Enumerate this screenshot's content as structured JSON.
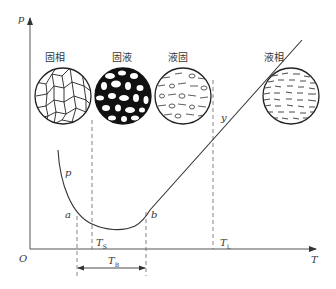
{
  "diagram": {
    "axes": {
      "y_label": "p",
      "x_label": "T",
      "origin_label": "O"
    },
    "phases": [
      {
        "label": "固相",
        "texture": "solid-grains"
      },
      {
        "label": "固液",
        "texture": "solid-liquid-dark"
      },
      {
        "label": "液固",
        "texture": "liquid-solid"
      },
      {
        "label": "液相",
        "texture": "liquid-streaks"
      }
    ],
    "curve_labels": {
      "p": "p",
      "y": "y",
      "a": "a",
      "b": "b"
    },
    "temperatures": {
      "TS": {
        "main": "T",
        "sub": "S"
      },
      "TL": {
        "main": "T",
        "sub": "L"
      },
      "TB": {
        "main": "T",
        "sub": "B"
      }
    },
    "colors": {
      "line": "#333333",
      "axis": "#555555",
      "dashed": "#666666"
    }
  }
}
